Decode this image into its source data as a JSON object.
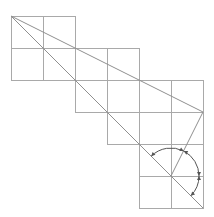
{
  "diagram": {
    "type": "grid-with-diagonals-and-angle-arcs",
    "cell_size": 32,
    "colors": {
      "grid": "#a9a9a9",
      "lines": "#8f8f8f",
      "arcs": "#555555",
      "background": "#ffffff"
    },
    "grid_rows": [
      {
        "y": 16,
        "x_start": 11,
        "cells": 2
      },
      {
        "y": 48,
        "x_start": 11,
        "cells": 4
      },
      {
        "y": 80,
        "x_start": 75,
        "cells": 4
      },
      {
        "y": 112,
        "x_start": 107,
        "cells": 3
      },
      {
        "y": 144,
        "x_start": 139,
        "cells": 2
      },
      {
        "y": 176,
        "x_start": 139,
        "cells": 2
      }
    ],
    "lines": [
      {
        "name": "steep-diagonal",
        "x1": 11,
        "y1": 16,
        "x2": 203,
        "y2": 208
      },
      {
        "name": "shallow-diagonal",
        "x1": 11,
        "y1": 16,
        "x2": 203,
        "y2": 112
      },
      {
        "name": "return-segment",
        "x1": 203,
        "y1": 112,
        "x2": 171,
        "y2": 176
      }
    ],
    "angle_center": {
      "x": 171,
      "y": 176
    },
    "arcs": [
      {
        "name": "arc-upper",
        "radius": 28,
        "from_deg": 135,
        "to_deg": 63
      },
      {
        "name": "arc-right",
        "radius": 28,
        "from_deg": 63,
        "to_deg": 0
      },
      {
        "name": "arc-lower",
        "radius": 28,
        "from_deg": 0,
        "to_deg": -45
      }
    ]
  }
}
